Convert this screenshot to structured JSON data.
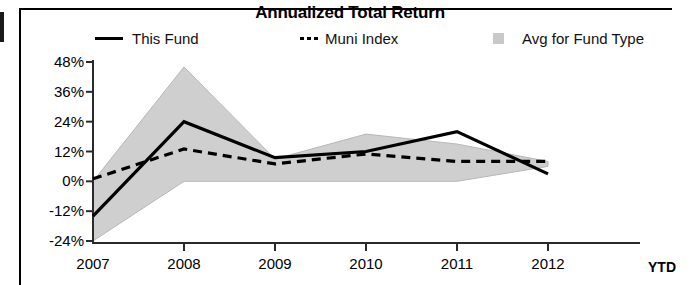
{
  "chart_data": {
    "type": "line",
    "title": "Annualized Total Return",
    "xlabel": "",
    "ylabel": "",
    "x": [
      "2007",
      "2008",
      "2009",
      "2010",
      "2011",
      "2012"
    ],
    "x_note": "YTD",
    "categories": [
      "2007",
      "2008",
      "2009",
      "2010",
      "2011",
      "2012"
    ],
    "xtick_labels": [
      "2007",
      "2008",
      "2009",
      "2010",
      "2011",
      "2012"
    ],
    "ytick_labels": [
      "48%",
      "36%",
      "24%",
      "12%",
      "0%",
      "-12%",
      "-24%"
    ],
    "ytick_values": [
      48,
      36,
      24,
      12,
      0,
      -12,
      -24
    ],
    "ylim": [
      -24,
      48
    ],
    "grid": false,
    "legend_position": "top",
    "series": [
      {
        "name": "This Fund",
        "style": "solid",
        "color": "#000000",
        "values": [
          -14,
          24,
          9.5,
          12,
          20,
          3
        ]
      },
      {
        "name": "Muni Index",
        "style": "dashed",
        "color": "#000000",
        "values": [
          1,
          13,
          7,
          11,
          8,
          8
        ]
      },
      {
        "name": "Avg for Fund Type",
        "style": "area-band",
        "color": "#c9c9c9",
        "upper": [
          0,
          46,
          9,
          19,
          15,
          8
        ],
        "lower": [
          -24,
          0,
          0,
          0,
          0,
          6
        ]
      }
    ]
  },
  "chart": {
    "title": "Annualized Total Return",
    "ytd_label": "YTD"
  },
  "legend": {
    "items": [
      {
        "label": "This Fund",
        "marker": "solid-line"
      },
      {
        "label": "Muni Index",
        "marker": "dashed-line"
      },
      {
        "label": "Avg for Fund Type",
        "marker": "area-swatch"
      }
    ]
  }
}
